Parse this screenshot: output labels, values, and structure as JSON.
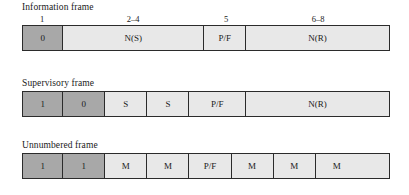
{
  "diagram": {
    "name": "HDLC control field formats",
    "colors": {
      "dark_cell": "#a8a8a8",
      "light_cell": "#e8e8e8",
      "border": "#2b2b2b",
      "background": "#ffffff",
      "text": "#1a1a1a"
    },
    "frames": [
      {
        "id": "information",
        "title": "Information frame",
        "show_bit_numbers": true,
        "bit_labels": [
          {
            "text": "1",
            "center_pct": 5.5
          },
          {
            "text": "2–4",
            "center_pct": 30.2
          },
          {
            "text": "5",
            "center_pct": 55.5
          },
          {
            "text": "6–8",
            "center_pct": 80.5
          }
        ],
        "cells": [
          {
            "label": "0",
            "shade": "dark",
            "width_pct": 11.0
          },
          {
            "label": "N(S)",
            "shade": "light",
            "width_pct": 38.5
          },
          {
            "label": "P/F",
            "shade": "light",
            "width_pct": 11.5
          },
          {
            "label": "N(R)",
            "shade": "light",
            "width_pct": 39.0
          }
        ]
      },
      {
        "id": "supervisory",
        "title": "Supervisory frame",
        "show_bit_numbers": false,
        "bit_labels": [],
        "cells": [
          {
            "label": "1",
            "shade": "dark",
            "width_pct": 11.0
          },
          {
            "label": "0",
            "shade": "dark",
            "width_pct": 11.5
          },
          {
            "label": "S",
            "shade": "light",
            "width_pct": 11.5
          },
          {
            "label": "S",
            "shade": "light",
            "width_pct": 11.5
          },
          {
            "label": "P/F",
            "shade": "light",
            "width_pct": 15.5
          },
          {
            "label": "N(R)",
            "shade": "light",
            "width_pct": 39.0
          }
        ]
      },
      {
        "id": "unnumbered",
        "title": "Unnumbered frame",
        "show_bit_numbers": false,
        "bit_labels": [],
        "cells": [
          {
            "label": "1",
            "shade": "dark",
            "width_pct": 11.0
          },
          {
            "label": "1",
            "shade": "dark",
            "width_pct": 11.5
          },
          {
            "label": "M",
            "shade": "light",
            "width_pct": 11.5
          },
          {
            "label": "M",
            "shade": "light",
            "width_pct": 11.5
          },
          {
            "label": "P/F",
            "shade": "light",
            "width_pct": 11.5
          },
          {
            "label": "M",
            "shade": "light",
            "width_pct": 11.5
          },
          {
            "label": "M",
            "shade": "light",
            "width_pct": 11.5
          },
          {
            "label": "M",
            "shade": "light",
            "width_pct": 11.5
          }
        ]
      }
    ]
  }
}
